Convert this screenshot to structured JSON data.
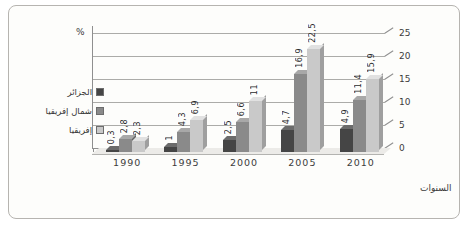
{
  "chart_data": {
    "type": "bar",
    "title": "",
    "categories": [
      "1990",
      "1995",
      "2000",
      "2005",
      "2010"
    ],
    "series": [
      {
        "name": "الجزائر",
        "values": [
          0.3,
          1,
          2.5,
          4.7,
          4.9
        ],
        "labels": [
          "0,3",
          "1",
          "2,5",
          "4,7",
          "4,9"
        ],
        "color": "#454545",
        "top_color": "#6b6b6b",
        "side_color": "#2e2e2e"
      },
      {
        "name": "شمال إفريقيا",
        "values": [
          2.8,
          4.3,
          6.6,
          16.9,
          11.4
        ],
        "labels": [
          "2,8",
          "4,3",
          "6,6",
          "16,9",
          "11,4"
        ],
        "color": "#8a8a8a",
        "top_color": "#a8a8a8",
        "side_color": "#616161"
      },
      {
        "name": "إفريقيا",
        "values": [
          2.3,
          6.9,
          11,
          22.5,
          15.9
        ],
        "labels": [
          "2,3",
          "6,9",
          "11",
          "22,5",
          "15,9"
        ],
        "color": "#c9c9c9",
        "top_color": "#e1e1e1",
        "side_color": "#9f9f9f"
      }
    ],
    "ylabel": "%",
    "xlabel": "السنوات",
    "ylim": [
      0,
      25
    ],
    "yticks": [
      0,
      5,
      10,
      15,
      20,
      25
    ],
    "grid": true,
    "legend_position": "left",
    "bar_style": "3d",
    "axis_side": "right"
  },
  "colors": {
    "frame_border": "#b6b4b0",
    "gridline": "#ababa8",
    "axis_line": "#8f8f8f",
    "background": "#fdfdfb"
  }
}
